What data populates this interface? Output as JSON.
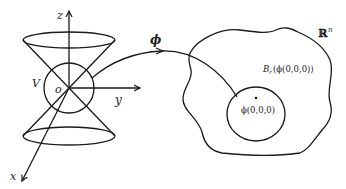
{
  "diagram": {
    "type": "mapping-illustration",
    "labels": {
      "z_axis": "z",
      "y_axis": "y",
      "x_axis": "x",
      "origin": "o",
      "neighborhood": "V",
      "map": "ϕ",
      "space": "ℝ",
      "space_exponent": "n",
      "ball_prefix": "B",
      "ball_subscript": "r",
      "ball_arg": "(ϕ(0,0,0))",
      "center_point": "ϕ(0,0,0)"
    },
    "colors": {
      "stroke": "#1a1a1a",
      "background": "#ffffff"
    }
  }
}
